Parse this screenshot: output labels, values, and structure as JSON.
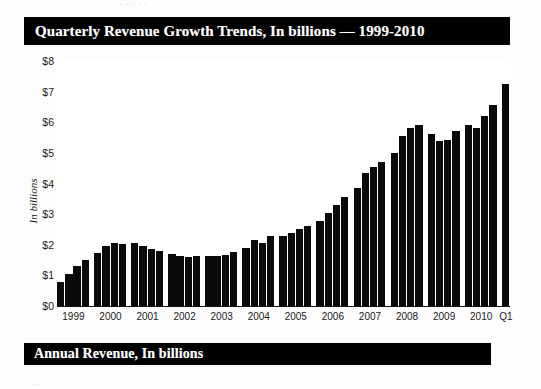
{
  "top_crop_text": "·  ·    ·   ·     ·",
  "title_banner": {
    "label": "Quarterly Revenue Growth Trends, In billions — 1999-2010"
  },
  "annual_banner": {
    "label": "Annual Revenue, In billions"
  },
  "bottom_crop_text": "· — · · ·  ·  · · ·",
  "colors": {
    "banner_background": "#000000",
    "banner_text": "#ffffff",
    "bar": "#0a0a0a",
    "plot_background": "#ffffff",
    "axis_text": "#1a1a1a"
  },
  "chart_data": {
    "type": "bar",
    "title": "Quarterly Revenue Growth Trends, In billions — 1999-2010",
    "xlabel": "",
    "ylabel": "In billions",
    "ylim": [
      0,
      8
    ],
    "ytick_labels": [
      "$0",
      "$1",
      "$2",
      "$3",
      "$4",
      "$5",
      "$6",
      "$7",
      "$8"
    ],
    "ytick_values": [
      0,
      1,
      2,
      3,
      4,
      5,
      6,
      7,
      8
    ],
    "grid": false,
    "legend": "none",
    "group_labels": [
      "1999",
      "2000",
      "2001",
      "2002",
      "2003",
      "2004",
      "2005",
      "2006",
      "2007",
      "2008",
      "2009",
      "2010",
      "Q1"
    ],
    "categories": [
      "1999 Q1",
      "1999 Q2",
      "1999 Q3",
      "1999 Q4",
      "2000 Q1",
      "2000 Q2",
      "2000 Q3",
      "2000 Q4",
      "2001 Q1",
      "2001 Q2",
      "2001 Q3",
      "2001 Q4",
      "2002 Q1",
      "2002 Q2",
      "2002 Q3",
      "2002 Q4",
      "2003 Q1",
      "2003 Q2",
      "2003 Q3",
      "2003 Q4",
      "2004 Q1",
      "2004 Q2",
      "2004 Q3",
      "2004 Q4",
      "2005 Q1",
      "2005 Q2",
      "2005 Q3",
      "2005 Q4",
      "2006 Q1",
      "2006 Q2",
      "2006 Q3",
      "2006 Q4",
      "2007 Q1",
      "2007 Q2",
      "2007 Q3",
      "2007 Q4",
      "2008 Q1",
      "2008 Q2",
      "2008 Q3",
      "2008 Q4",
      "2009 Q1",
      "2009 Q2",
      "2009 Q3",
      "2009 Q4",
      "2010 Q1",
      "2010 Q2",
      "2010 Q3",
      "2010 Q4",
      "Q1"
    ],
    "values": [
      0.8,
      1.05,
      1.3,
      1.5,
      1.72,
      1.95,
      2.05,
      2.02,
      2.05,
      1.95,
      1.85,
      1.8,
      1.7,
      1.62,
      1.6,
      1.62,
      1.62,
      1.62,
      1.66,
      1.75,
      1.88,
      2.15,
      2.05,
      2.28,
      2.3,
      2.4,
      2.52,
      2.62,
      2.78,
      3.05,
      3.3,
      3.55,
      3.85,
      4.35,
      4.55,
      4.7,
      5.0,
      5.55,
      5.8,
      5.9,
      5.62,
      5.4,
      5.42,
      5.72,
      5.9,
      5.8,
      6.2,
      6.55,
      7.25
    ]
  }
}
